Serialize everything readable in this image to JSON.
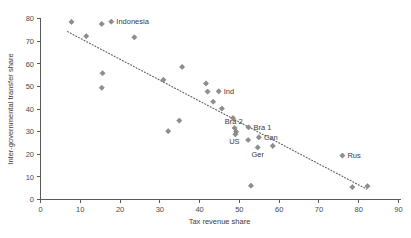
{
  "chart_data": {
    "type": "scatter",
    "title": "",
    "subtitle": "",
    "xlabel": "Tax revenue share",
    "ylabel": "Inter-governmental transfer share",
    "xlim": [
      0,
      90
    ],
    "ylim": [
      0,
      80
    ],
    "xticks": [
      0,
      10,
      20,
      30,
      40,
      50,
      60,
      70,
      80,
      90
    ],
    "yticks": [
      0,
      10,
      20,
      30,
      40,
      50,
      60,
      70,
      80
    ],
    "grid": false,
    "legend": null,
    "marker_style": "diamond",
    "marker_color": "#8e8e8e",
    "trendline": {
      "style": "dotted",
      "color": "#5d5d5d",
      "x_start": 6.8,
      "y_start": 74.2,
      "x_end": 82.0,
      "y_end": 4.6
    },
    "points": [
      {
        "x": 7.8,
        "y": 78.5,
        "label": ""
      },
      {
        "x": 11.5,
        "y": 72.2,
        "label": ""
      },
      {
        "x": 15.4,
        "y": 77.6,
        "label": ""
      },
      {
        "x": 17.8,
        "y": 78.6,
        "label": "Indonesia"
      },
      {
        "x": 15.6,
        "y": 55.8,
        "label": ""
      },
      {
        "x": 15.4,
        "y": 49.4,
        "label": ""
      },
      {
        "x": 23.6,
        "y": 71.7,
        "label": ""
      },
      {
        "x": 30.9,
        "y": 52.9,
        "label": ""
      },
      {
        "x": 32.1,
        "y": 30.2,
        "label": ""
      },
      {
        "x": 34.9,
        "y": 34.9,
        "label": ""
      },
      {
        "x": 35.6,
        "y": 58.6,
        "label": ""
      },
      {
        "x": 41.6,
        "y": 51.3,
        "label": ""
      },
      {
        "x": 42.0,
        "y": 47.7,
        "label": ""
      },
      {
        "x": 43.4,
        "y": 43.2,
        "label": ""
      },
      {
        "x": 44.8,
        "y": 47.8,
        "label": "Ind"
      },
      {
        "x": 45.6,
        "y": 40.2,
        "label": ""
      },
      {
        "x": 48.4,
        "y": 36.0,
        "label": ""
      },
      {
        "x": 48.8,
        "y": 31.6,
        "label": "Bra 2"
      },
      {
        "x": 49.2,
        "y": 30.0,
        "label": ""
      },
      {
        "x": 49.0,
        "y": 28.8,
        "label": "US"
      },
      {
        "x": 52.3,
        "y": 31.9,
        "label": "Bra 1"
      },
      {
        "x": 52.2,
        "y": 26.3,
        "label": ""
      },
      {
        "x": 54.9,
        "y": 27.5,
        "label": "Can"
      },
      {
        "x": 54.6,
        "y": 23.0,
        "label": "Ger"
      },
      {
        "x": 58.4,
        "y": 23.7,
        "label": ""
      },
      {
        "x": 52.9,
        "y": 6.1,
        "label": ""
      },
      {
        "x": 75.9,
        "y": 19.4,
        "label": "Rus"
      },
      {
        "x": 78.4,
        "y": 5.5,
        "label": ""
      },
      {
        "x": 82.2,
        "y": 5.9,
        "label": ""
      }
    ]
  },
  "plot": {
    "x_axis_label": "Tax revenue share",
    "y_axis_label": "Inter-governmental transfer share"
  }
}
